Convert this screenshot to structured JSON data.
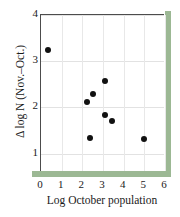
{
  "chart_data": {
    "type": "scatter",
    "title": "",
    "xlabel": "Log October population",
    "ylabel": "Δ log N (Nov.–Oct.)",
    "xlim": [
      0,
      6
    ],
    "ylim": [
      0.6,
      4
    ],
    "xticks": [
      "0",
      "1",
      "2",
      "3",
      "4",
      "5",
      "6"
    ],
    "yticks": [
      "1",
      "2",
      "3",
      "4"
    ],
    "xtick_values": [
      0,
      1,
      2,
      3,
      4,
      5,
      6
    ],
    "ytick_values": [
      1,
      2,
      3,
      4
    ],
    "grid": "both",
    "legend": "none",
    "marker": "filled-circle",
    "marker_color": "#111111",
    "points": [
      {
        "x": 0.33,
        "y": 3.25
      },
      {
        "x": 2.23,
        "y": 2.12
      },
      {
        "x": 2.5,
        "y": 2.28
      },
      {
        "x": 2.35,
        "y": 1.33
      },
      {
        "x": 3.1,
        "y": 2.57
      },
      {
        "x": 3.1,
        "y": 1.84
      },
      {
        "x": 3.45,
        "y": 1.71
      },
      {
        "x": 5.0,
        "y": 1.31
      }
    ]
  },
  "figure": {
    "accent_color": "#9cb894",
    "axis_color": "#4c4c4c",
    "grid_color": "#e4e4e4",
    "background": "#ffffff"
  }
}
